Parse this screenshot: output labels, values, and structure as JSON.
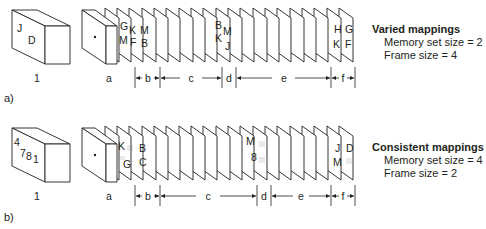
{
  "panels": [
    {
      "tag": "a)",
      "cube_label": "1",
      "cube_letters": [
        "J",
        "D"
      ],
      "mask_label": "a",
      "frames_with_letters": [
        {
          "index": 0,
          "letters": [
            "G",
            "M"
          ]
        },
        {
          "index": 1,
          "letters": [
            "K",
            "F"
          ]
        },
        {
          "index": 2,
          "letters": [
            "M",
            "B"
          ]
        },
        {
          "index": 9,
          "letters": [
            "B",
            "K",
            "M",
            "J"
          ]
        },
        {
          "index": 17,
          "letters": [
            "H",
            "K"
          ]
        },
        {
          "index": 18,
          "letters": [
            "G",
            "F"
          ]
        }
      ],
      "intervals": [
        "b",
        "c",
        "d",
        "e",
        "f"
      ],
      "legend": {
        "title": "Varied mappings",
        "memory_set": "Memory set size = 2",
        "frame_size": "Frame size = 4"
      }
    },
    {
      "tag": "b)",
      "cube_label": "1",
      "cube_letters": [
        "4",
        "7",
        "8",
        "1"
      ],
      "mask_label": "a",
      "frames_with_letters": [
        {
          "index": 0,
          "letters": [
            "K",
            "G"
          ]
        },
        {
          "index": 1,
          "letters": [
            "B",
            "C"
          ]
        },
        {
          "index": 10,
          "letters": [
            "M",
            "8"
          ]
        },
        {
          "index": 17,
          "letters": [
            "J",
            "M"
          ]
        },
        {
          "index": 18,
          "letters": [
            "D"
          ]
        }
      ],
      "intervals": [
        "b",
        "c",
        "d",
        "e",
        "f"
      ],
      "legend": {
        "title": "Consistent mappings",
        "memory_set": "Memory set size = 4",
        "frame_size": "Frame size = 2"
      }
    }
  ]
}
